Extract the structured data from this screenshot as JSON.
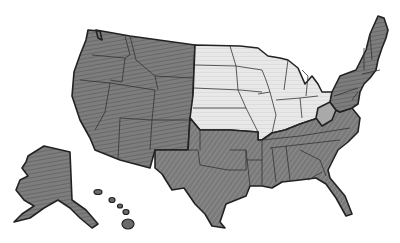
{
  "map": {
    "subject": "United States (hand-shaded outline map)",
    "colors": {
      "dark_shade": "#7a7a7a",
      "medium_shade": "#a6a6a6",
      "light_shade": "#e4e4e4",
      "border": "#222222",
      "background": "#ffffff"
    },
    "regions": [
      {
        "name": "West",
        "shade": "dark",
        "states": [
          "WA",
          "OR",
          "CA",
          "ID",
          "NV",
          "MT",
          "WY",
          "UT",
          "CO",
          "AZ",
          "NM",
          "AK",
          "HI"
        ]
      },
      {
        "name": "Midwest",
        "shade": "light",
        "states": [
          "ND",
          "SD",
          "NE",
          "KS",
          "MN",
          "IA",
          "MO",
          "WI",
          "IL",
          "MI",
          "IN",
          "OH"
        ]
      },
      {
        "name": "South",
        "shade": "dark",
        "states": [
          "TX",
          "OK",
          "AR",
          "LA",
          "MS",
          "AL",
          "TN",
          "KY",
          "GA",
          "FL",
          "SC",
          "NC",
          "VA",
          "MD",
          "DE"
        ]
      },
      {
        "name": "Northeast",
        "shade": "dark",
        "states": [
          "PA",
          "NY",
          "NJ",
          "CT",
          "RI",
          "MA",
          "VT",
          "NH",
          "ME"
        ]
      },
      {
        "name": "West Virginia",
        "shade": "medium",
        "states": [
          "WV"
        ]
      }
    ]
  }
}
